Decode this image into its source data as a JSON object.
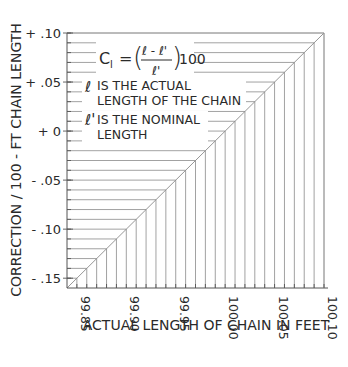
{
  "chart_data": {
    "type": "line",
    "title": "",
    "xlabel": "ACTUAL LENGTH OF CHAIN IN FEET",
    "ylabel": "CORRECTION / 100 - FT CHAIN LENGTH",
    "xlim": [
      99.84,
      100.1
    ],
    "ylim": [
      -0.16,
      0.1
    ],
    "x_ticks": [
      99.85,
      99.9,
      99.95,
      100.0,
      100.05,
      100.1
    ],
    "x_tick_labels": [
      "99.85",
      "99.90",
      "99.95",
      "100.00",
      "100.05",
      "100.10"
    ],
    "y_ticks": [
      0.1,
      0.05,
      0.0,
      -0.05,
      -0.1,
      -0.15
    ],
    "y_tick_labels": [
      "+ .10",
      "+ .05",
      "+ 0",
      "- .05",
      "- .10",
      "- .15"
    ],
    "minor_step": 0.01,
    "grid": "horizontal lines to diagonal from left axis, vertical lines to diagonal from bottom axis",
    "series": [
      {
        "name": "Correction",
        "x": [
          99.85,
          100.1
        ],
        "y": [
          -0.15,
          0.1
        ]
      }
    ],
    "annotations": {
      "formula_lhs": "C",
      "formula_sub": "l",
      "formula_num": "ℓ - ℓ'",
      "formula_den": "ℓ'",
      "formula_mult": "100",
      "note1_symbol": "ℓ",
      "note1_line1": "IS THE ACTUAL",
      "note1_line2": "LENGTH OF THE CHAIN",
      "note2_symbol": "ℓ'",
      "note2_line1": "IS THE NOMINAL",
      "note2_line2": "LENGTH"
    }
  }
}
